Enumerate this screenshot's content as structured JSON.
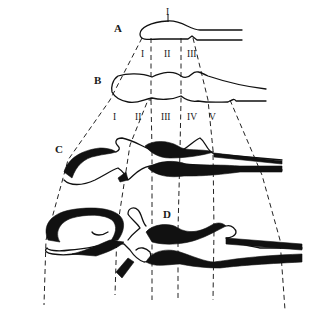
{
  "diagram": {
    "stages": [
      {
        "id": "A",
        "label": "A",
        "regions": [
          "I",
          "II",
          "III"
        ],
        "top_marker": "I"
      },
      {
        "id": "B",
        "label": "B",
        "regions": [
          "I",
          "II",
          "III",
          "IV",
          "V"
        ]
      },
      {
        "id": "C",
        "label": "C"
      },
      {
        "id": "D",
        "label": "D"
      }
    ],
    "colors": {
      "ink": "#111111",
      "background": "#ffffff"
    }
  }
}
